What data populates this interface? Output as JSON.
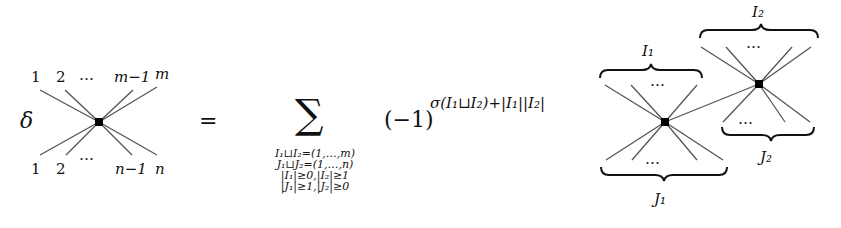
{
  "equation": {
    "operator": "δ",
    "equals": "=",
    "sum_symbol": "∑",
    "sum_conditions": [
      "I₁⊔I₂=(1,…,m)",
      "J₁⊔J₂=(1,…,n)",
      "|I₁|≥0,|I₂|≥1",
      "|J₁|≥1,|J₂|≥0"
    ],
    "sign_base": "(−1)",
    "sign_exponent": "σ(I₁⊔I₂)+|I₁||I₂|"
  },
  "left_vertex": {
    "top_labels": [
      "1",
      "2",
      "…",
      "m−1",
      "m"
    ],
    "bottom_labels": [
      "1",
      "2",
      "…",
      "n−1",
      "n"
    ]
  },
  "right_diagram": {
    "vertex1": {
      "top_label": "I₁",
      "bottom_label": "J₁",
      "dots": "…"
    },
    "vertex2": {
      "top_label": "I₂",
      "bottom_label": "J₂",
      "dots": "…"
    }
  },
  "colors": {
    "line": "#555555",
    "vertex": "#000000"
  }
}
